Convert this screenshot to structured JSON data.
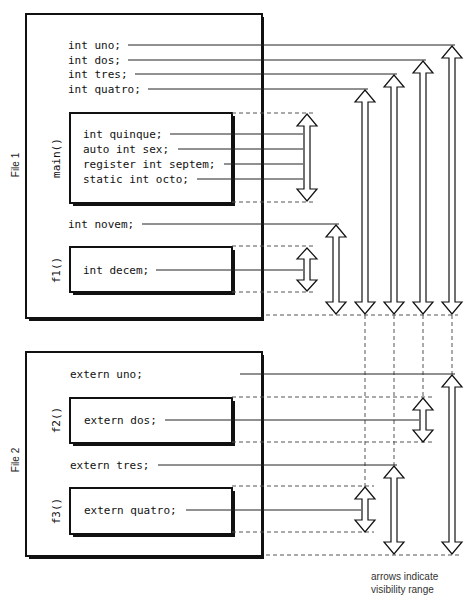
{
  "file1": {
    "label": "File 1",
    "globals": [
      "int uno;",
      "int dos;",
      "int tres;",
      "int quatro;"
    ],
    "main": {
      "label": "main()",
      "lines": [
        "int quinque;",
        "auto int sex;",
        "register int septem;",
        "static int octo;"
      ]
    },
    "between": "int novem;",
    "f1": {
      "label": "f1()",
      "lines": [
        "int decem;"
      ]
    }
  },
  "file2": {
    "label": "File 2",
    "extern_uno": "extern uno;",
    "f2": {
      "label": "f2()",
      "lines": [
        "extern dos;"
      ]
    },
    "extern_tres": "extern tres;",
    "f3": {
      "label": "f3()",
      "lines": [
        "extern quatro;"
      ]
    }
  },
  "legend": {
    "line1": "arrows indicate",
    "line2": "visibility range"
  },
  "colors": {
    "stroke": "#111111",
    "dashed": "#555555",
    "background": "#ffffff"
  }
}
